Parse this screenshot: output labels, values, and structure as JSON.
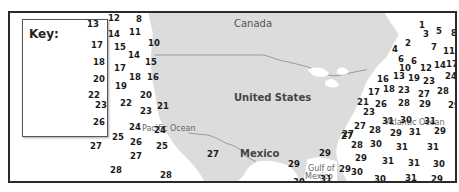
{
  "map": {
    "key_title": "Key:",
    "labels": {
      "canada": "Canada",
      "united_states": "United States",
      "mexico": "Mexico",
      "pacific": "Pacific Ocean",
      "atlantic": "Atlantic Ocean",
      "gulf_line1": "Gulf of",
      "gulf_line2": "Mexico"
    },
    "colors": {
      "land": "#dcdcdc",
      "water": "#ffffff",
      "border": "#2a2a2a",
      "text": "#1a1a1a"
    },
    "values": [
      {
        "v": "12",
        "x": 106,
        "y": 12
      },
      {
        "v": "8",
        "x": 134,
        "y": 13
      },
      {
        "v": "13",
        "x": 85,
        "y": 18
      },
      {
        "v": "14",
        "x": 106,
        "y": 28
      },
      {
        "v": "11",
        "x": 127,
        "y": 26
      },
      {
        "v": "17",
        "x": 89,
        "y": 39
      },
      {
        "v": "15",
        "x": 112,
        "y": 41
      },
      {
        "v": "10",
        "x": 146,
        "y": 37
      },
      {
        "v": "14",
        "x": 126,
        "y": 49
      },
      {
        "v": "18",
        "x": 91,
        "y": 56
      },
      {
        "v": "17",
        "x": 112,
        "y": 62
      },
      {
        "v": "15",
        "x": 143,
        "y": 56
      },
      {
        "v": "20",
        "x": 91,
        "y": 73
      },
      {
        "v": "18",
        "x": 127,
        "y": 71
      },
      {
        "v": "16",
        "x": 145,
        "y": 71
      },
      {
        "v": "19",
        "x": 113,
        "y": 80
      },
      {
        "v": "22",
        "x": 86,
        "y": 89
      },
      {
        "v": "20",
        "x": 138,
        "y": 89
      },
      {
        "v": "23",
        "x": 93,
        "y": 99
      },
      {
        "v": "22",
        "x": 118,
        "y": 97
      },
      {
        "v": "23",
        "x": 138,
        "y": 105
      },
      {
        "v": "21",
        "x": 155,
        "y": 100
      },
      {
        "v": "26",
        "x": 91,
        "y": 116
      },
      {
        "v": "24",
        "x": 127,
        "y": 121
      },
      {
        "v": "24",
        "x": 152,
        "y": 124
      },
      {
        "v": "25",
        "x": 110,
        "y": 131
      },
      {
        "v": "26",
        "x": 128,
        "y": 136
      },
      {
        "v": "25",
        "x": 154,
        "y": 140
      },
      {
        "v": "27",
        "x": 88,
        "y": 140
      },
      {
        "v": "27",
        "x": 128,
        "y": 150
      },
      {
        "v": "27",
        "x": 205,
        "y": 148
      },
      {
        "v": "28",
        "x": 108,
        "y": 164
      },
      {
        "v": "28",
        "x": 158,
        "y": 169
      },
      {
        "v": "1",
        "x": 417,
        "y": 19
      },
      {
        "v": "3",
        "x": 421,
        "y": 28
      },
      {
        "v": "5",
        "x": 434,
        "y": 25
      },
      {
        "v": "8",
        "x": 449,
        "y": 27
      },
      {
        "v": "2",
        "x": 403,
        "y": 37
      },
      {
        "v": "4",
        "x": 390,
        "y": 43
      },
      {
        "v": "7",
        "x": 429,
        "y": 41
      },
      {
        "v": "11",
        "x": 441,
        "y": 45
      },
      {
        "v": "6",
        "x": 396,
        "y": 53
      },
      {
        "v": "6",
        "x": 409,
        "y": 55
      },
      {
        "v": "10",
        "x": 397,
        "y": 62
      },
      {
        "v": "12",
        "x": 418,
        "y": 62
      },
      {
        "v": "14",
        "x": 432,
        "y": 59
      },
      {
        "v": "17",
        "x": 444,
        "y": 58
      },
      {
        "v": "16",
        "x": 375,
        "y": 73
      },
      {
        "v": "13",
        "x": 391,
        "y": 70
      },
      {
        "v": "19",
        "x": 406,
        "y": 72
      },
      {
        "v": "23",
        "x": 421,
        "y": 75
      },
      {
        "v": "24",
        "x": 443,
        "y": 70
      },
      {
        "v": "17",
        "x": 366,
        "y": 86
      },
      {
        "v": "18",
        "x": 381,
        "y": 83
      },
      {
        "v": "23",
        "x": 396,
        "y": 84
      },
      {
        "v": "27",
        "x": 416,
        "y": 88
      },
      {
        "v": "28",
        "x": 435,
        "y": 85
      },
      {
        "v": "21",
        "x": 355,
        "y": 96
      },
      {
        "v": "26",
        "x": 373,
        "y": 98
      },
      {
        "v": "28",
        "x": 396,
        "y": 97
      },
      {
        "v": "29",
        "x": 417,
        "y": 98
      },
      {
        "v": "29",
        "x": 446,
        "y": 99
      },
      {
        "v": "23",
        "x": 361,
        "y": 106
      },
      {
        "v": "31",
        "x": 380,
        "y": 115
      },
      {
        "v": "30",
        "x": 398,
        "y": 114
      },
      {
        "v": "31",
        "x": 422,
        "y": 115
      },
      {
        "v": "27",
        "x": 352,
        "y": 120
      },
      {
        "v": "28",
        "x": 367,
        "y": 124
      },
      {
        "v": "29",
        "x": 388,
        "y": 127
      },
      {
        "v": "31",
        "x": 407,
        "y": 126
      },
      {
        "v": "29",
        "x": 432,
        "y": 125
      },
      {
        "v": "27",
        "x": 339,
        "y": 130
      },
      {
        "v": "28",
        "x": 349,
        "y": 139
      },
      {
        "v": "30",
        "x": 368,
        "y": 138
      },
      {
        "v": "31",
        "x": 394,
        "y": 141
      },
      {
        "v": "31",
        "x": 425,
        "y": 141
      },
      {
        "v": "29",
        "x": 353,
        "y": 152
      },
      {
        "v": "31",
        "x": 380,
        "y": 155
      },
      {
        "v": "31",
        "x": 406,
        "y": 157
      },
      {
        "v": "30",
        "x": 431,
        "y": 158
      },
      {
        "v": "30",
        "x": 349,
        "y": 166
      },
      {
        "v": "30",
        "x": 372,
        "y": 173
      },
      {
        "v": "31",
        "x": 403,
        "y": 172
      },
      {
        "v": "29",
        "x": 429,
        "y": 173
      },
      {
        "v": "29",
        "x": 317,
        "y": 147
      },
      {
        "v": "29",
        "x": 286,
        "y": 158
      },
      {
        "v": "29",
        "x": 337,
        "y": 163
      },
      {
        "v": "30",
        "x": 291,
        "y": 176
      },
      {
        "v": "31",
        "x": 318,
        "y": 173
      },
      {
        "v": "27",
        "x": 340,
        "y": 128
      }
    ]
  }
}
